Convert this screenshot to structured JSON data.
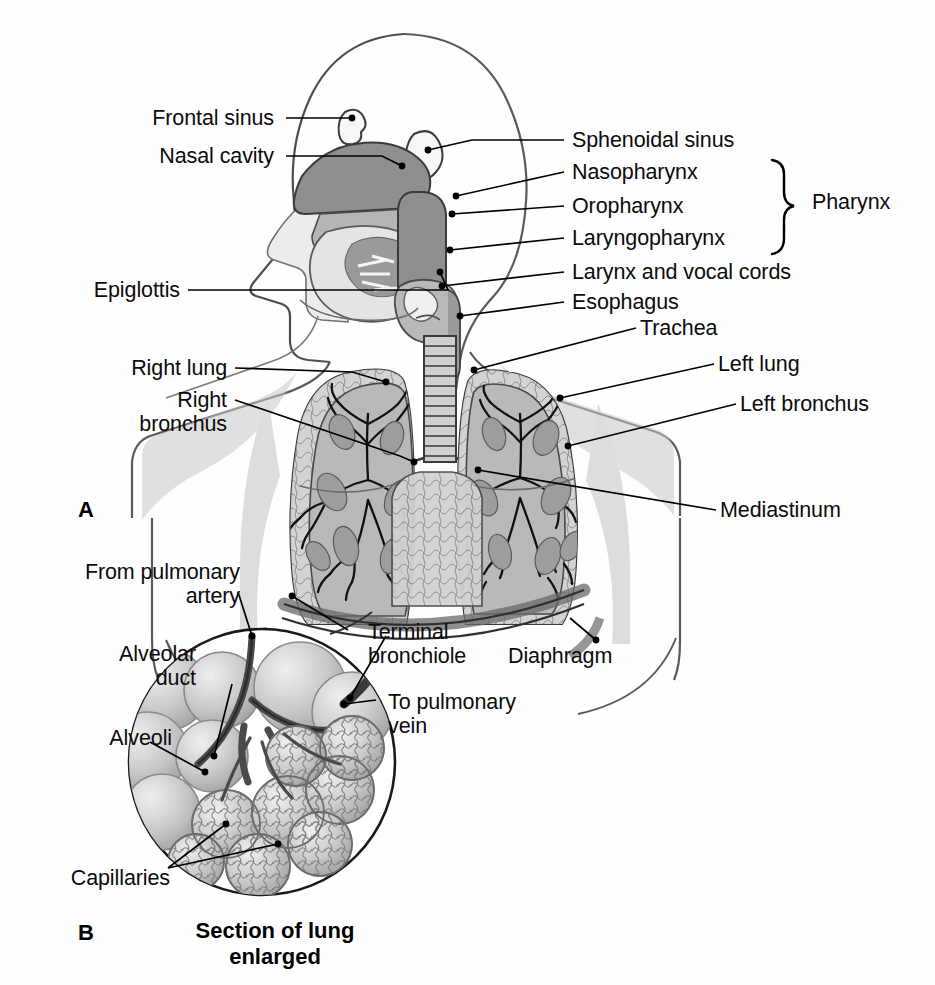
{
  "figure": {
    "background_color": "#ffffff",
    "ink_color": "#0b0b0b",
    "tone_light": "#d8d8d8",
    "tone_mid": "#b0b0b0",
    "tone_dark": "#8a8a8a",
    "tone_darker": "#6f6f6f"
  },
  "panels": {
    "a": {
      "letter": "A"
    },
    "b": {
      "letter": "B",
      "caption_line1": "Section of lung",
      "caption_line2": "enlarged"
    }
  },
  "labels_left_upper": [
    {
      "id": "frontal-sinus",
      "text": "Frontal sinus"
    },
    {
      "id": "nasal-cavity",
      "text": "Nasal cavity"
    },
    {
      "id": "epiglottis",
      "text": "Epiglottis"
    },
    {
      "id": "right-lung",
      "text": "Right lung"
    },
    {
      "id": "right-bronchus-line1",
      "text": "Right"
    },
    {
      "id": "right-bronchus-line2",
      "text": "bronchus"
    }
  ],
  "labels_right_upper": [
    {
      "id": "sphenoidal-sinus",
      "text": "Sphenoidal sinus"
    },
    {
      "id": "nasopharynx",
      "text": "Nasopharynx"
    },
    {
      "id": "oropharynx",
      "text": "Oropharynx"
    },
    {
      "id": "laryngopharynx",
      "text": "Laryngopharynx"
    },
    {
      "id": "larynx-and-vocal-cords",
      "text": "Larynx and vocal cords"
    },
    {
      "id": "esophagus",
      "text": "Esophagus"
    },
    {
      "id": "trachea",
      "text": "Trachea"
    },
    {
      "id": "left-lung",
      "text": "Left lung"
    },
    {
      "id": "left-bronchus",
      "text": "Left bronchus"
    },
    {
      "id": "mediastinum",
      "text": "Mediastinum"
    }
  ],
  "bracket_group": {
    "id": "pharynx",
    "text": "Pharynx"
  },
  "labels_lower": [
    {
      "id": "from-pulmonary-artery-line1",
      "text": "From pulmonary"
    },
    {
      "id": "from-pulmonary-artery-line2",
      "text": "artery"
    },
    {
      "id": "alveolar-duct-line1",
      "text": "Alveolar"
    },
    {
      "id": "alveolar-duct-line2",
      "text": "duct"
    },
    {
      "id": "alveoli",
      "text": "Alveoli"
    },
    {
      "id": "capillaries",
      "text": "Capillaries"
    },
    {
      "id": "terminal-bronchiole-line1",
      "text": "Terminal"
    },
    {
      "id": "terminal-bronchiole-line2",
      "text": "bronchiole"
    },
    {
      "id": "to-pulmonary-vein-line1",
      "text": "To pulmonary"
    },
    {
      "id": "to-pulmonary-vein-line2",
      "text": "vein"
    },
    {
      "id": "diaphragm",
      "text": "Diaphragm"
    }
  ]
}
